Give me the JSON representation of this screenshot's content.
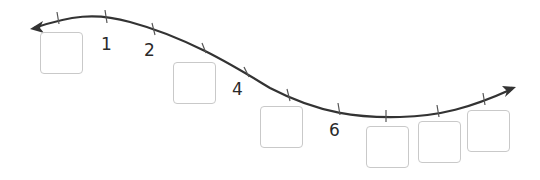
{
  "number_line": {
    "description": "Curved number line with blanks to fill",
    "labels": [
      {
        "value": "1",
        "position": 1
      },
      {
        "value": "2",
        "position": 2
      },
      {
        "value": "4",
        "position": 4
      },
      {
        "value": "6",
        "position": 6
      }
    ],
    "blanks": [
      0,
      3,
      5,
      7,
      8,
      9
    ],
    "line_color": "#333333",
    "box_border_color": "#c9c9c9"
  }
}
